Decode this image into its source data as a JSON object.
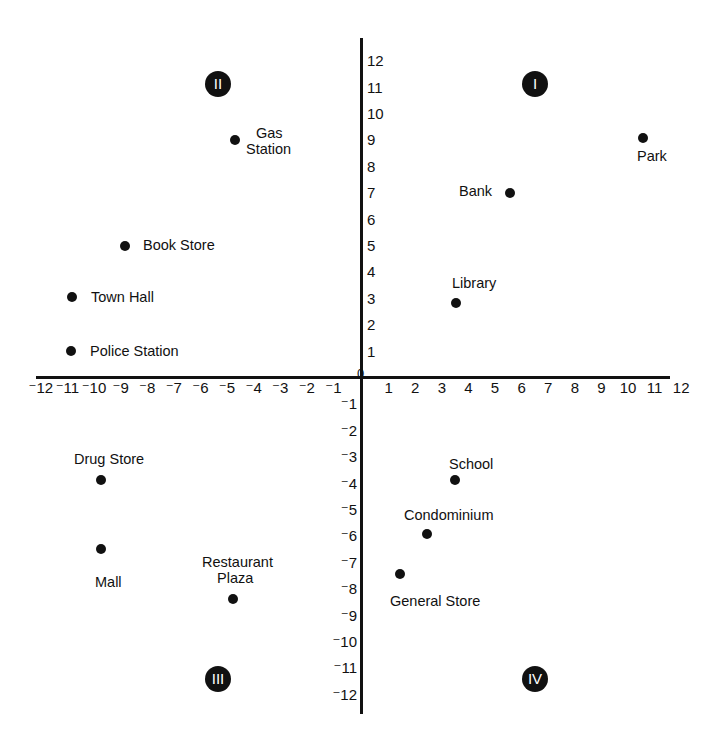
{
  "chart_data": {
    "type": "scatter",
    "title": "",
    "xlabel": "",
    "ylabel": "",
    "xlim": [
      -12,
      12
    ],
    "ylim": [
      -12,
      12
    ],
    "grid": false,
    "origin_label": "0",
    "x_ticks": [
      "⁻12",
      "⁻11",
      "⁻10",
      "⁻9",
      "⁻8",
      "⁻7",
      "⁻6",
      "⁻5",
      "⁻4",
      "⁻3",
      "⁻2",
      "⁻1",
      "1",
      "2",
      "3",
      "4",
      "5",
      "6",
      "7",
      "8",
      "9",
      "10",
      "11",
      "12"
    ],
    "y_ticks": [
      "12",
      "11",
      "10",
      "9",
      "8",
      "7",
      "6",
      "5",
      "4",
      "3",
      "2",
      "1",
      "⁻1",
      "⁻2",
      "⁻3",
      "⁻4",
      "⁻5",
      "⁻6",
      "⁻7",
      "⁻8",
      "⁻9",
      "⁻10",
      "⁻11",
      "⁻12"
    ],
    "quadrants": [
      {
        "label": "I",
        "x": 7,
        "y": 11.5
      },
      {
        "label": "II",
        "x": -5.4,
        "y": 11.5
      },
      {
        "label": "III",
        "x": -5.4,
        "y": -11.5
      },
      {
        "label": "IV",
        "x": 6.5,
        "y": -11.5
      }
    ],
    "points": [
      {
        "name": "Gas Station",
        "lines": [
          "Gas",
          "Station"
        ],
        "x": -5,
        "y": 9
      },
      {
        "name": "Book Store",
        "lines": [
          "Book Store"
        ],
        "x": -9,
        "y": 5
      },
      {
        "name": "Town Hall",
        "lines": [
          "Town Hall"
        ],
        "x": -11,
        "y": 3
      },
      {
        "name": "Police Station",
        "lines": [
          "Police Station"
        ],
        "x": -11,
        "y": 1
      },
      {
        "name": "Park",
        "lines": [
          "Park"
        ],
        "x": 11,
        "y": 9
      },
      {
        "name": "Bank",
        "lines": [
          "Bank"
        ],
        "x": 6,
        "y": 7
      },
      {
        "name": "Library",
        "lines": [
          "Library"
        ],
        "x": 4,
        "y": 3
      },
      {
        "name": "Drug Store",
        "lines": [
          "Drug Store"
        ],
        "x": -10,
        "y": -4
      },
      {
        "name": "Mall",
        "lines": [
          "Mall"
        ],
        "x": -10,
        "y": -7
      },
      {
        "name": "Restaurant Plaza",
        "lines": [
          "Restaurant",
          "Plaza"
        ],
        "x": -5,
        "y": -9
      },
      {
        "name": "School",
        "lines": [
          "School"
        ],
        "x": 4,
        "y": -4
      },
      {
        "name": "Condominium",
        "lines": [
          "Condominium"
        ],
        "x": 3,
        "y": -6
      },
      {
        "name": "General Store",
        "lines": [
          "General Store"
        ],
        "x": 2,
        "y": -8
      }
    ]
  },
  "labels": {
    "origin": "0",
    "quadrant_I": "I",
    "quadrant_II": "II",
    "quadrant_III": "III",
    "quadrant_IV": "IV",
    "gas_station_1": "Gas",
    "gas_station_2": "Station",
    "book_store": "Book Store",
    "town_hall": "Town Hall",
    "police_station": "Police Station",
    "park": "Park",
    "bank": "Bank",
    "library": "Library",
    "drug_store": "Drug Store",
    "mall": "Mall",
    "restaurant_1": "Restaurant",
    "restaurant_2": "Plaza",
    "school": "School",
    "condominium": "Condominium",
    "general_store": "General Store"
  }
}
